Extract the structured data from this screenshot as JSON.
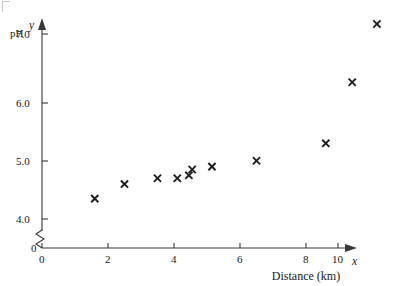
{
  "chart_data": {
    "type": "scatter",
    "title": "",
    "xlabel": "Distance (km)",
    "ylabel": "pH",
    "x_axis_symbol": "x",
    "y_axis_symbol": "y",
    "xlim": [
      0,
      11
    ],
    "ylim": [
      3.7,
      7.6
    ],
    "y_axis_break": true,
    "y_break_note": "axis broken between 0 and 4.0",
    "grid": false,
    "legend": null,
    "xticks": [
      0,
      2,
      4,
      6,
      8,
      10
    ],
    "xtick_labels": [
      "0",
      "2",
      "4",
      "6",
      "8",
      "10"
    ],
    "yticks": [
      4.0,
      5.0,
      6.0,
      7.0
    ],
    "ytick_labels": [
      "4.0",
      "5.0",
      "6.0",
      "7.0"
    ],
    "y_origin_label": "0",
    "marker": "x",
    "marker_color": "#1f1f1f",
    "n_points": 11,
    "x": [
      1.6,
      2.5,
      3.5,
      4.1,
      4.45,
      4.55,
      5.15,
      6.5,
      8.6,
      9.4,
      10.15
    ],
    "y": [
      4.35,
      4.6,
      4.7,
      4.7,
      4.75,
      4.85,
      4.9,
      5.0,
      5.3,
      6.35,
      7.35
    ],
    "points": [
      {
        "x": 1.6,
        "y": 4.35
      },
      {
        "x": 2.5,
        "y": 4.6
      },
      {
        "x": 3.5,
        "y": 4.7
      },
      {
        "x": 4.1,
        "y": 4.7
      },
      {
        "x": 4.45,
        "y": 4.75
      },
      {
        "x": 4.55,
        "y": 4.85
      },
      {
        "x": 5.15,
        "y": 4.9
      },
      {
        "x": 6.5,
        "y": 5.0
      },
      {
        "x": 8.6,
        "y": 5.3
      },
      {
        "x": 9.4,
        "y": 6.35
      },
      {
        "x": 10.15,
        "y": 7.35
      }
    ]
  }
}
